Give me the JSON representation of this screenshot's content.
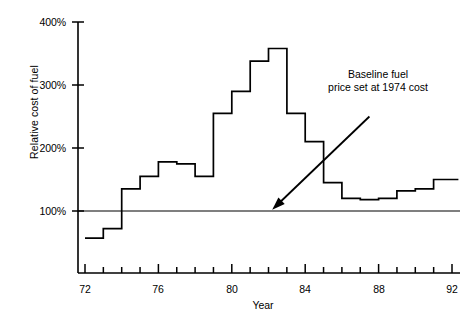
{
  "chart_data": {
    "type": "line",
    "subtype": "step-post",
    "title": "",
    "xlabel": "Year",
    "ylabel": "Relative cost of fuel",
    "xlim": [
      71.5,
      92.5
    ],
    "ylim": [
      0,
      400
    ],
    "grid": false,
    "legend": null,
    "x": [
      72,
      73,
      74,
      75,
      76,
      77,
      78,
      79,
      80,
      81,
      82,
      83,
      84,
      85,
      86,
      87,
      88,
      89,
      90,
      91,
      92
    ],
    "values": [
      57,
      72,
      135,
      155,
      178,
      175,
      155,
      255,
      290,
      338,
      358,
      255,
      210,
      145,
      120,
      118,
      120,
      132,
      135,
      150,
      150
    ],
    "x_tick_labels": [
      "72",
      "",
      "",
      "",
      "76",
      "",
      "",
      "",
      "80",
      "",
      "",
      "",
      "84",
      "",
      "",
      "",
      "88",
      "",
      "",
      "",
      "92"
    ],
    "x_major_ticks": [
      72,
      76,
      80,
      84,
      88,
      92
    ],
    "y_tick_labels": [
      "100%",
      "200%",
      "300%",
      "400%"
    ],
    "y_major_ticks": [
      100,
      200,
      300,
      400
    ],
    "reference_line": {
      "value": 100,
      "label": "Baseline fuel\nprice set at 1974 cost"
    },
    "annotations": [
      {
        "text": "Baseline  fuel\nprice set at 1974 cost",
        "arrow_from_x": 87.5,
        "arrow_from_y": 250,
        "arrow_to_x": 82.2,
        "arrow_to_y": 102
      }
    ],
    "line_color": "#000000",
    "baseline_color": "#000000",
    "background_color": "#ffffff"
  },
  "axes": {
    "y_label": "Relative cost of fuel",
    "x_label": "Year"
  }
}
